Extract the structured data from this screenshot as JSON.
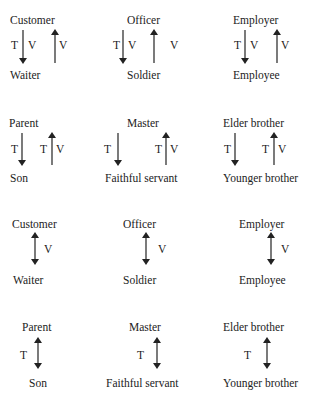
{
  "colors": {
    "text": "#222222",
    "arrow": "#222222",
    "background": "#ffffff"
  },
  "rows": [
    {
      "type": "unidirectional",
      "pairs": [
        {
          "top": "Customer",
          "bottom": "Waiter",
          "down_labels": [
            "T",
            "V"
          ],
          "up_labels": [
            "V"
          ]
        },
        {
          "top": "Officer",
          "bottom": "Soldier",
          "down_labels": [
            "T",
            "V"
          ],
          "up_labels": [
            "V"
          ]
        },
        {
          "top": "Employer",
          "bottom": "Employee",
          "down_labels": [
            "T",
            "V"
          ],
          "up_labels": [
            "V"
          ]
        }
      ]
    },
    {
      "type": "unidirectional",
      "pairs": [
        {
          "top": "Parent",
          "bottom": "Son",
          "down_labels": [
            "T"
          ],
          "up_labels": [
            "T",
            "V"
          ]
        },
        {
          "top": "Master",
          "bottom": "Faithful servant",
          "down_labels": [
            "T"
          ],
          "up_labels": [
            "T",
            "V"
          ]
        },
        {
          "top": "Elder brother",
          "bottom": "Younger brother",
          "down_labels": [
            "T"
          ],
          "up_labels": [
            "T",
            "V"
          ]
        }
      ]
    },
    {
      "type": "bidirectional",
      "pairs": [
        {
          "top": "Customer",
          "bottom": "Waiter",
          "label": "V"
        },
        {
          "top": "Officer",
          "bottom": "Soldier",
          "label": "V"
        },
        {
          "top": "Employer",
          "bottom": "Employee",
          "label": "V"
        }
      ]
    },
    {
      "type": "bidirectional",
      "pairs": [
        {
          "top": "Parent",
          "bottom": "Son",
          "label": "T"
        },
        {
          "top": "Master",
          "bottom": "Faithful servant",
          "label": "T"
        },
        {
          "top": "Elder brother",
          "bottom": "Younger brother",
          "label": "T"
        }
      ]
    }
  ],
  "icons": {
    "down": "arrow-down-icon",
    "up": "arrow-up-icon",
    "double": "double-arrow-icon"
  }
}
